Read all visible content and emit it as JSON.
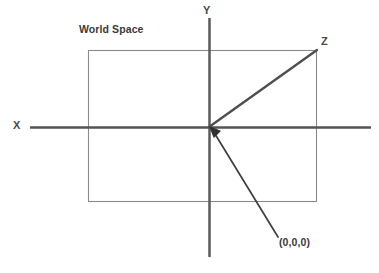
{
  "diagram": {
    "title": "World Space",
    "type": "coordinate-axes-diagram",
    "labels": {
      "x_axis": "X",
      "y_axis": "Y",
      "z_axis": "Z",
      "origin": "(0,0,0)"
    },
    "colors": {
      "background": "#ffffff",
      "axis_line": "#555555",
      "rect_border": "#808080",
      "z_line": "#4f4f4f",
      "pointer_line": "#3f3f3f",
      "text": "#3a3a3a"
    },
    "geometry": {
      "origin": [
        209,
        127
      ],
      "x_axis": {
        "from": [
          30,
          127
        ],
        "to": [
          371,
          127
        ]
      },
      "y_axis": {
        "from": [
          209,
          18
        ],
        "to": [
          209,
          257
        ]
      },
      "z_axis": {
        "from": [
          209,
          127
        ],
        "to": [
          317,
          50
        ]
      },
      "world_rect": {
        "x": 88,
        "y": 50,
        "width": 229,
        "height": 152
      },
      "origin_pointer": {
        "from": [
          278,
          237
        ],
        "to": [
          212,
          130
        ]
      }
    }
  }
}
